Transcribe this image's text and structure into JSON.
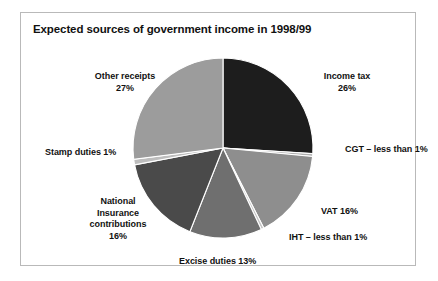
{
  "figure": {
    "title": "Expected sources of government income in 1998/99",
    "border_color": "#b9b9b9",
    "background": "#ffffff"
  },
  "chart_data": {
    "type": "pie",
    "title": "Expected sources of government income in 1998/99",
    "xlabel": "",
    "ylabel": "",
    "legend_position": "none",
    "grid": false,
    "start_angle_deg": 0,
    "direction": "clockwise",
    "categories": [
      "Income tax",
      "CGT",
      "VAT",
      "IHT",
      "Excise duties",
      "National Insurance contributions",
      "Stamp duties",
      "Other receipts"
    ],
    "values": [
      26,
      0.5,
      16,
      0.5,
      13,
      16,
      1,
      27
    ],
    "value_labels": [
      "26%",
      "less than 1%",
      "16%",
      "less than 1%",
      "13%",
      "16%",
      "1%",
      "27%"
    ],
    "colors": [
      "#1d1d1d",
      "#b0b0b0",
      "#8e8e8e",
      "#c4c4c4",
      "#6f6f6f",
      "#4a4a4a",
      "#bdbdbd",
      "#9c9c9c"
    ],
    "slices": [
      {
        "name": "income-tax",
        "label": "Income tax",
        "pct": 26,
        "pct_text": "26%",
        "color": "#1d1d1d"
      },
      {
        "name": "cgt",
        "label": "CGT",
        "pct": 0.5,
        "pct_text": "less than 1%",
        "color": "#b0b0b0"
      },
      {
        "name": "vat",
        "label": "VAT",
        "pct": 16,
        "pct_text": "16%",
        "color": "#8e8e8e"
      },
      {
        "name": "iht",
        "label": "IHT",
        "pct": 0.5,
        "pct_text": "less than 1%",
        "color": "#c4c4c4"
      },
      {
        "name": "excise",
        "label": "Excise duties",
        "pct": 13,
        "pct_text": "13%",
        "color": "#6f6f6f"
      },
      {
        "name": "nic",
        "label": "National Insurance contributions",
        "pct": 16,
        "pct_text": "16%",
        "color": "#4a4a4a"
      },
      {
        "name": "stamp",
        "label": "Stamp duties",
        "pct": 1,
        "pct_text": "1%",
        "color": "#bdbdbd"
      },
      {
        "name": "other",
        "label": "Other receipts",
        "pct": 27,
        "pct_text": "27%",
        "color": "#9c9c9c"
      }
    ]
  },
  "labels": {
    "other_receipts_l1": "Other receipts",
    "other_receipts_l2": "27%",
    "income_tax_l1": "Income tax",
    "income_tax_l2": "26%",
    "cgt": "CGT – less than 1%",
    "vat": "VAT 16%",
    "iht": "IHT – less than 1%",
    "excise": "Excise duties 13%",
    "nic_l1": "National",
    "nic_l2": "Insurance",
    "nic_l3": "contributions",
    "nic_l4": "16%",
    "stamp": "Stamp duties 1%"
  }
}
